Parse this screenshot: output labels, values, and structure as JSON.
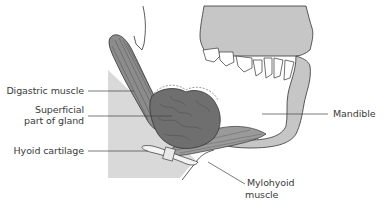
{
  "diagram": {
    "labels": {
      "digastric_muscle": "Digastric muscle",
      "superficial_part_line1": "Superficial",
      "superficial_part_line2": "part of gland",
      "hyoid_cartilage": "Hyoid cartilage",
      "mandible": "Mandible",
      "mylohyoid_line1": "Mylohyoid",
      "mylohyoid_line2": "muscle"
    },
    "colors": {
      "bone": "#c8c8c8",
      "neck_shade": "#d6d6d6",
      "muscle": "#8a8a8a",
      "gland": "#6e6e6e",
      "outline": "#333333",
      "leader_line": "#444444",
      "text": "#3a3a3a"
    }
  }
}
